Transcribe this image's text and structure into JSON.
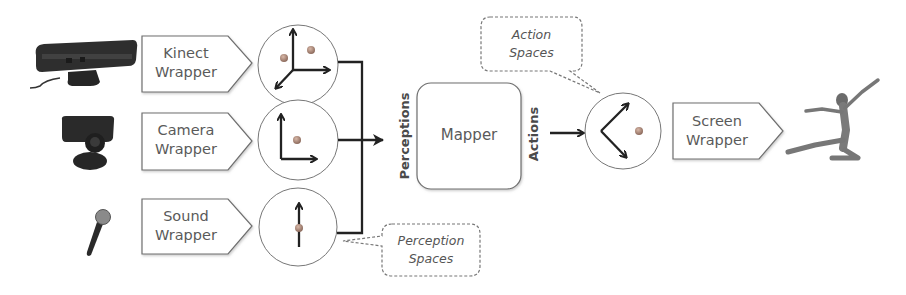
{
  "diagram": {
    "inputs": [
      {
        "device": "kinect-sensor",
        "wrapper_line1": "Kinect",
        "wrapper_line2": "Wrapper",
        "space": "3D axes with two points"
      },
      {
        "device": "camera",
        "wrapper_line1": "Camera",
        "wrapper_line2": "Wrapper",
        "space": "2D axes with one point"
      },
      {
        "device": "microphone",
        "wrapper_line1": "Sound",
        "wrapper_line2": "Wrapper",
        "space": "1D axis with one point"
      }
    ],
    "perceptions_label": "Perceptions",
    "mapper_label": "Mapper",
    "actions_label": "Actions",
    "output": {
      "space": "2D action axes with one point",
      "wrapper_line1": "Screen",
      "wrapper_line2": "Wrapper",
      "avatar": "dancer"
    },
    "callouts": {
      "perception_line1": "Perception",
      "perception_line2": "Spaces",
      "action_line1": "Action",
      "action_line2": "Spaces"
    },
    "colors": {
      "stroke": "#333333",
      "box_border": "#777777",
      "text": "#5a5a5a",
      "point": "#b08a7a",
      "device_dark": "#2b2b2b"
    }
  }
}
